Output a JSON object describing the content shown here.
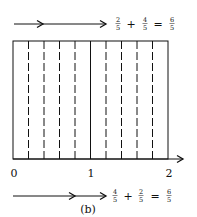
{
  "figure": {
    "caption": "(b)",
    "top_equation": {
      "a_num": "2",
      "a_den": "5",
      "plus": "+",
      "b_num": "4",
      "b_den": "5",
      "equals": "=",
      "r_num": "6",
      "r_den": "5"
    },
    "bottom_equation": {
      "a_num": "4",
      "a_den": "5",
      "plus": "+",
      "b_num": "2",
      "b_den": "5",
      "equals": "=",
      "r_num": "6",
      "r_den": "5"
    },
    "axis": {
      "ticks": [
        "0",
        "1",
        "2"
      ]
    },
    "rectangle": {
      "divisions": 10,
      "solid_divider_at": 1
    },
    "colors": {
      "ink": "#111111",
      "background": "#ffffff"
    }
  }
}
